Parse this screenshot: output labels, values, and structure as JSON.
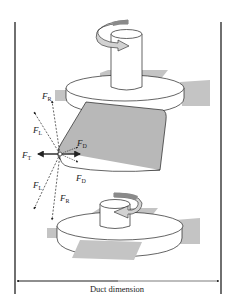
{
  "figure": {
    "caption": "Duct dimension",
    "colors": {
      "outline": "#222222",
      "blade_fill": "#b8b8b8",
      "vane_fill": "#c4c4c4",
      "arrow_fill": "#cfcfcf",
      "arrow_dark": "#8a8a8a"
    },
    "forces": [
      {
        "id": "FR_top",
        "symbol": "F",
        "sub": "R"
      },
      {
        "id": "FL_top",
        "symbol": "F",
        "sub": "L"
      },
      {
        "id": "FD_top",
        "symbol": "F",
        "sub": "D"
      },
      {
        "id": "FT",
        "symbol": "F",
        "sub": "T"
      },
      {
        "id": "FD_bottom",
        "symbol": "F",
        "sub": "D"
      },
      {
        "id": "FL_bottom",
        "symbol": "F",
        "sub": "L"
      },
      {
        "id": "FR_bottom",
        "symbol": "F",
        "sub": "R"
      }
    ],
    "labels": {
      "fr_top": "F",
      "fr_top_sub": "R",
      "fl_top": "F",
      "fl_top_sub": "L",
      "fd_top": "F",
      "fd_top_sub": "D",
      "ft": "F",
      "ft_sub": "T",
      "fd_bottom": "F",
      "fd_bottom_sub": "D",
      "fl_bottom": "F",
      "fl_bottom_sub": "L",
      "fr_bottom": "F",
      "fr_bottom_sub": "R"
    }
  }
}
